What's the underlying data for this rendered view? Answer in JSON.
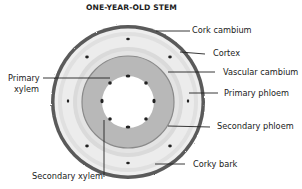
{
  "diagram": {
    "title": "ONE-YEAR-OLD STEM",
    "colors": {
      "bark": "#555555",
      "outer_ring": "#e2e2e2",
      "cortex_ring": "#d4d4d4",
      "phloem_ring": "#e8e8e8",
      "vascular_cambium_line": "#8a8a8a",
      "secondary_xylem": "#b4b4b4",
      "pith": "#ffffff",
      "bundle_dot": "#222222",
      "leader_line": "#222222"
    },
    "labels": {
      "cork_cambium": "Cork cambium",
      "cortex": "Cortex",
      "vascular_cambium": "Vascular cambium",
      "primary_phloem": "Primary phloem",
      "secondary_phloem": "Secondary phloem",
      "corky_bark": "Corky bark",
      "primary_xylem_line1": "Primary",
      "primary_xylem_line2": "xylem",
      "secondary_xylem": "Secondary xylem"
    }
  }
}
